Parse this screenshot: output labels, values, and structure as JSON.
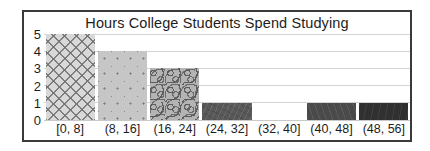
{
  "chart_data": {
    "type": "bar",
    "title": "Hours College Students Spend Studying",
    "xlabel": "",
    "ylabel": "",
    "categories": [
      "[0, 8]",
      "(8, 16]",
      "(16, 24]",
      "(24, 32]",
      "(32, 40]",
      "(40, 48]",
      "(48, 56]"
    ],
    "values": [
      5,
      4,
      3,
      1,
      0,
      1,
      1
    ],
    "ylim": [
      0,
      5
    ],
    "yticks": [
      "5",
      "4",
      "3",
      "2",
      "1",
      "0"
    ],
    "ytick_values": [
      5,
      4,
      3,
      2,
      1,
      0
    ],
    "grid": true,
    "legend": "none",
    "bar_fills": [
      "crosshatch",
      "dotted",
      "squiggle",
      "dark-grey",
      "empty",
      "darker-grey",
      "near-black"
    ],
    "colors": {
      "frame": "#3a3a3a",
      "gridline": "#d3d3d3",
      "text": "#1d1d1d",
      "background": "#ffffff",
      "bar_1": "#d8d8d8",
      "bar_2": "#c6c6c6",
      "bar_3": "#b4b4b4",
      "bar_4": "#585858",
      "bar_6": "#4a4a4a",
      "bar_7": "#303030"
    }
  }
}
